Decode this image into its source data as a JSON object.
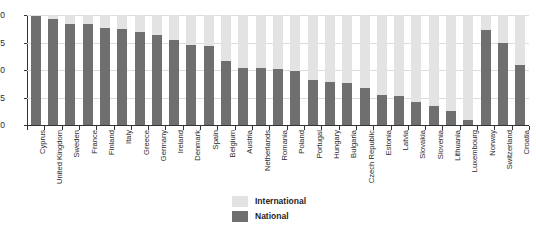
{
  "chart": {
    "title": "",
    "legend": {
      "international_label": "International",
      "national_label": "National",
      "international_color": "#e3e3e3",
      "national_color": "#6f6f6f"
    }
  },
  "chart_data": {
    "type": "bar",
    "stacked": true,
    "title": "",
    "subtitle": "",
    "xlabel": "",
    "ylabel": "",
    "ylim": [
      0,
      100
    ],
    "yticks": [
      0,
      25,
      50,
      75,
      100
    ],
    "ytick_labels": [
      "0",
      "25",
      "50",
      "75",
      "100"
    ],
    "grid": true,
    "legend_position": "bottom-center",
    "categories": [
      "Cyprus",
      "United Kingdom",
      "Sweden",
      "France",
      "Finland",
      "Italy",
      "Greece",
      "Germany",
      "Ireland",
      "Denmark",
      "Spain",
      "Belgium",
      "Austria",
      "Netherlands",
      "Romania",
      "Poland",
      "Portugal",
      "Hungary",
      "Bulgaria",
      "Czech Republic",
      "Estonia",
      "Latvia",
      "Slovakia",
      "Slovenia",
      "Lithuania",
      "Luxembourg",
      "Norway",
      "Switzerland",
      "Croatia"
    ],
    "series": [
      {
        "name": "National",
        "color": "#6f6f6f",
        "values": [
          99,
          96,
          92,
          92,
          88,
          87,
          85,
          82,
          77,
          73,
          72,
          58,
          52,
          52,
          51,
          49,
          41,
          39,
          38,
          34,
          27,
          26,
          21,
          17,
          13,
          5,
          86,
          75,
          55
        ]
      },
      {
        "name": "International",
        "color": "#e3e3e3",
        "values": [
          1,
          4,
          8,
          8,
          12,
          13,
          15,
          18,
          23,
          27,
          28,
          42,
          48,
          48,
          49,
          51,
          59,
          61,
          62,
          66,
          73,
          74,
          79,
          83,
          87,
          95,
          14,
          25,
          45
        ]
      }
    ]
  }
}
